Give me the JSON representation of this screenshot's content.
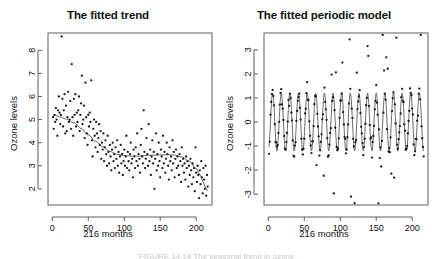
{
  "figure": {
    "caption": "FIGURE 14.14  The seasonal trend in ozone",
    "background": "#ffffff",
    "point_color": "#1a1a1a",
    "line_color": "#3a3a3a",
    "axis_color": "#4d4d4d"
  },
  "chart_data": [
    {
      "type": "scatter",
      "panel": "left",
      "title": "The fitted trend",
      "xlabel": "216 months",
      "ylabel": "Ozone levels",
      "xlim": [
        -6,
        222
      ],
      "ylim": [
        1.3,
        8.75
      ],
      "xticks": [
        0,
        50,
        100,
        150,
        200
      ],
      "yticks": [
        2,
        3,
        4,
        5,
        6,
        7,
        8
      ],
      "grid": false,
      "legend": "none",
      "series": [
        {
          "name": "ozone",
          "kind": "points",
          "x": [
            1,
            2,
            3,
            4,
            5,
            6,
            7,
            8,
            9,
            10,
            11,
            12,
            13,
            14,
            15,
            16,
            17,
            18,
            19,
            20,
            21,
            22,
            23,
            24,
            25,
            26,
            27,
            28,
            29,
            30,
            31,
            32,
            33,
            34,
            35,
            36,
            37,
            38,
            39,
            40,
            41,
            42,
            43,
            44,
            45,
            46,
            47,
            48,
            49,
            50,
            51,
            52,
            53,
            54,
            55,
            56,
            57,
            58,
            59,
            60,
            61,
            62,
            63,
            64,
            65,
            66,
            67,
            68,
            69,
            70,
            71,
            72,
            73,
            74,
            75,
            76,
            77,
            78,
            79,
            80,
            81,
            82,
            83,
            84,
            85,
            86,
            87,
            88,
            89,
            90,
            91,
            92,
            93,
            94,
            95,
            96,
            97,
            98,
            99,
            100,
            101,
            102,
            103,
            104,
            105,
            106,
            107,
            108,
            109,
            110,
            111,
            112,
            113,
            114,
            115,
            116,
            117,
            118,
            119,
            120,
            121,
            122,
            123,
            124,
            125,
            126,
            127,
            128,
            129,
            130,
            131,
            132,
            133,
            134,
            135,
            136,
            137,
            138,
            139,
            140,
            141,
            142,
            143,
            144,
            145,
            146,
            147,
            148,
            149,
            150,
            151,
            152,
            153,
            154,
            155,
            156,
            157,
            158,
            159,
            160,
            161,
            162,
            163,
            164,
            165,
            166,
            167,
            168,
            169,
            170,
            171,
            172,
            173,
            174,
            175,
            176,
            177,
            178,
            179,
            180,
            181,
            182,
            183,
            184,
            185,
            186,
            187,
            188,
            189,
            190,
            191,
            192,
            193,
            194,
            195,
            196,
            197,
            198,
            199,
            200,
            201,
            202,
            203,
            204,
            205,
            206,
            207,
            208,
            209,
            210,
            211,
            212,
            213,
            214,
            215,
            216
          ],
          "y": [
            5.1,
            4.6,
            5.2,
            4.9,
            5.5,
            5.0,
            4.3,
            5.4,
            6.0,
            5.3,
            4.8,
            5.2,
            8.6,
            5.9,
            4.7,
            5.4,
            6.1,
            4.4,
            5.6,
            4.5,
            5.1,
            6.2,
            4.9,
            5.0,
            5.8,
            4.6,
            7.4,
            5.1,
            4.3,
            5.9,
            5.2,
            6.1,
            4.7,
            5.3,
            4.9,
            5.4,
            6.0,
            4.5,
            5.2,
            5.7,
            6.9,
            4.8,
            5.0,
            5.6,
            4.2,
            6.6,
            5.1,
            4.4,
            3.9,
            5.2,
            4.7,
            5.3,
            4.9,
            6.7,
            4.1,
            3.4,
            4.6,
            5.0,
            4.3,
            3.8,
            4.9,
            4.4,
            3.6,
            4.2,
            4.8,
            3.9,
            4.5,
            3.3,
            4.0,
            3.7,
            4.4,
            3.2,
            3.8,
            4.1,
            3.5,
            3.0,
            4.3,
            3.6,
            3.1,
            3.9,
            3.4,
            2.8,
            3.7,
            4.0,
            3.2,
            3.5,
            2.9,
            3.8,
            3.3,
            4.1,
            3.0,
            3.6,
            2.7,
            3.4,
            3.9,
            3.1,
            3.5,
            2.6,
            3.2,
            3.7,
            3.0,
            3.4,
            4.3,
            2.9,
            3.6,
            3.2,
            2.8,
            3.5,
            4.0,
            3.1,
            3.3,
            2.5,
            3.7,
            3.4,
            2.9,
            3.8,
            3.2,
            4.4,
            3.0,
            3.5,
            3.3,
            2.7,
            3.9,
            4.6,
            3.4,
            3.1,
            5.4,
            3.6,
            2.9,
            3.3,
            4.2,
            3.5,
            3.0,
            4.8,
            3.2,
            3.7,
            2.6,
            3.4,
            4.1,
            3.1,
            3.6,
            2.0,
            3.3,
            4.4,
            2.8,
            3.5,
            3.0,
            4.0,
            3.2,
            2.5,
            3.7,
            3.4,
            2.9,
            4.3,
            3.1,
            3.6,
            2.7,
            3.3,
            4.0,
            3.5,
            3.0,
            2.4,
            3.8,
            3.2,
            3.4,
            2.8,
            4.1,
            3.1,
            3.6,
            2.5,
            3.3,
            3.7,
            2.9,
            3.4,
            3.0,
            2.6,
            3.5,
            3.2,
            2.3,
            3.8,
            3.0,
            3.3,
            2.7,
            3.1,
            2.4,
            3.4,
            2.9,
            3.2,
            2.1,
            3.0,
            2.6,
            3.3,
            2.8,
            2.2,
            3.1,
            2.5,
            2.9,
            1.9,
            3.8,
            2.7,
            2.3,
            3.0,
            2.6,
            1.6,
            2.8,
            2.2,
            3.2,
            2.5,
            1.8,
            2.9,
            2.4,
            2.0,
            3.0,
            1.7,
            2.6,
            2.1
          ]
        },
        {
          "name": "fitted trend (loess)",
          "kind": "line",
          "x": [
            1,
            10,
            20,
            30,
            40,
            50,
            60,
            70,
            80,
            90,
            100,
            110,
            120,
            130,
            140,
            150,
            160,
            170,
            180,
            190,
            200,
            205,
            210,
            213,
            216
          ],
          "y": [
            5.22,
            5.12,
            5.02,
            4.86,
            4.62,
            4.34,
            4.06,
            3.82,
            3.62,
            3.5,
            3.44,
            3.42,
            3.42,
            3.44,
            3.46,
            3.47,
            3.48,
            3.46,
            3.38,
            3.2,
            2.88,
            2.62,
            2.28,
            2.05,
            1.92
          ]
        }
      ]
    },
    {
      "type": "scatter",
      "panel": "right",
      "title": "The fitted periodic model",
      "xlabel": "216 months",
      "ylabel": "Ozone levels",
      "xlim": [
        -6,
        222
      ],
      "ylim": [
        -3.45,
        3.7
      ],
      "xticks": [
        0,
        50,
        100,
        150,
        200
      ],
      "yticks": [
        -3,
        -2,
        -1,
        0,
        1,
        2,
        3
      ],
      "grid": false,
      "legend": "none",
      "seasonal_period_months": 12,
      "series": [
        {
          "name": "detrended ozone",
          "kind": "points",
          "note": "seasonal residuals, amplitude about 1.2 with high outliers near 3"
        },
        {
          "name": "fitted periodic model",
          "kind": "line",
          "amplitude": 1.2,
          "period": 12,
          "phase_months": 3.0,
          "mean": 0.0
        }
      ]
    }
  ]
}
